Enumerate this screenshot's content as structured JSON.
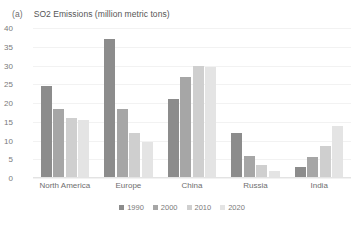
{
  "panel": {
    "tag": "(a)",
    "title": "SO2 Emissions (million metric tons)"
  },
  "chart_data": {
    "type": "bar",
    "title": "SO2 Emissions (million metric tons)",
    "xlabel": "",
    "ylabel": "",
    "ylim": [
      0,
      40
    ],
    "yticks": [
      40,
      35,
      30,
      25,
      20,
      15,
      10,
      5,
      0
    ],
    "grid": true,
    "legend_position": "bottom",
    "categories": [
      "North America",
      "Europe",
      "China",
      "Russia",
      "India"
    ],
    "series": [
      {
        "name": "1990",
        "color": "#8c8c8c",
        "values": [
          24.5,
          37.0,
          21.0,
          12.0,
          3.0
        ]
      },
      {
        "name": "2000",
        "color": "#a6a6a6",
        "values": [
          18.5,
          18.5,
          27.0,
          6.0,
          5.5
        ]
      },
      {
        "name": "2010",
        "color": "#cfcfcf",
        "values": [
          16.0,
          12.0,
          30.0,
          3.5,
          8.5
        ]
      },
      {
        "name": "2020",
        "color": "#e4e4e4",
        "values": [
          15.5,
          9.5,
          29.5,
          2.0,
          14.0
        ]
      }
    ]
  }
}
